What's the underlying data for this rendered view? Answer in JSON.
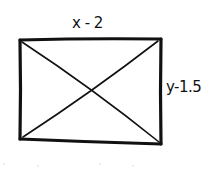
{
  "diagram": {
    "type": "hand-drawn rectangle with diagonals",
    "labels": {
      "top": "x - 2",
      "right": "y-1.5"
    },
    "colors": {
      "stroke": "#111111",
      "background": "#ffffff"
    }
  }
}
